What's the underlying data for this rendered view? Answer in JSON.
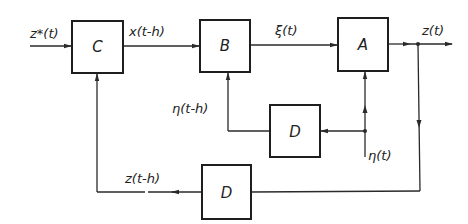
{
  "diagram": {
    "type": "block-diagram",
    "blocks": [
      {
        "id": "C",
        "label": "C"
      },
      {
        "id": "B",
        "label": "B"
      },
      {
        "id": "A",
        "label": "A"
      },
      {
        "id": "D1",
        "label": "D"
      },
      {
        "id": "D2",
        "label": "D"
      }
    ],
    "signals": {
      "input": "z*(t)",
      "c_to_b": "x(t-h)",
      "b_to_a": "ξ(t)",
      "output": "z(t)",
      "disturbance": "η(t)",
      "delayed_disturbance": "η(t-h)",
      "delayed_output": "z(t-h)"
    },
    "colors": {
      "line": "#2a2a2a",
      "background": "#ffffff"
    }
  }
}
